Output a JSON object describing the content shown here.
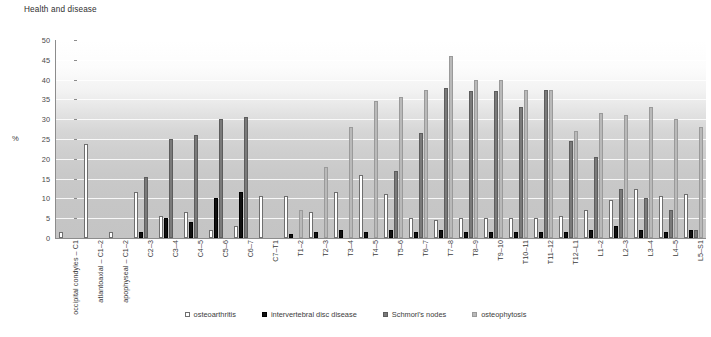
{
  "chart_data": {
    "type": "bar",
    "title": "Health and disease",
    "xlabel": "",
    "ylabel": "%",
    "ylim": [
      0,
      50
    ],
    "ytick_step": 5,
    "yticks": [
      0,
      5,
      10,
      15,
      20,
      25,
      30,
      35,
      40,
      45,
      50
    ],
    "grid": true,
    "legend_position": "bottom",
    "categories": [
      "occipital condyles – C1",
      "atlantoaxial – C1–2",
      "apophyseal – C1–2",
      "C2–3",
      "C3–4",
      "C4–5",
      "C5–6",
      "C6–7",
      "C7–T1",
      "T1–2",
      "T2–3",
      "T3–4",
      "T4–5",
      "T5–6",
      "T6–7",
      "T7–8",
      "T8–9",
      "T9–10",
      "T10–11",
      "T11–12",
      "T12–L1",
      "L1–2",
      "L2–3",
      "L3–4",
      "L4–5",
      "L5–S1"
    ],
    "series": [
      {
        "name": "osteoarthritis",
        "color": "#ffffff",
        "values": [
          1.5,
          23.8,
          1.5,
          11.5,
          5.5,
          6.5,
          2.0,
          3.0,
          10.5,
          10.5,
          6.5,
          11.5,
          16.0,
          11.0,
          5.0,
          4.5,
          5.0,
          5.0,
          5.0,
          5.0,
          5.5,
          7.0,
          9.5,
          12.5,
          10.5,
          11.0
        ]
      },
      {
        "name": "intervertebral disc disease",
        "color": "#111111",
        "values": [
          0.0,
          0.0,
          0.0,
          1.5,
          5.0,
          4.0,
          10.0,
          11.5,
          0.0,
          1.0,
          1.5,
          2.0,
          1.5,
          2.0,
          1.5,
          2.0,
          1.5,
          1.5,
          1.5,
          1.5,
          1.5,
          2.0,
          3.0,
          2.0,
          1.5,
          2.0
        ]
      },
      {
        "name": "Schmorl's nodes",
        "color": "#7a7a7a",
        "values": [
          0.0,
          0.0,
          0.0,
          15.5,
          25.0,
          26.0,
          30.0,
          30.5,
          0.0,
          0.0,
          0.0,
          0.0,
          0.0,
          17.0,
          26.5,
          38.0,
          37.0,
          37.0,
          33.0,
          37.5,
          24.5,
          20.5,
          12.5,
          10.0,
          7.0,
          2.0
        ]
      },
      {
        "name": "osteophytosis",
        "color": "#b9b9b9",
        "values": [
          0.0,
          0.0,
          0.0,
          0.0,
          0.0,
          0.0,
          0.0,
          0.0,
          0.0,
          7.0,
          18.0,
          28.0,
          34.5,
          35.5,
          37.5,
          46.0,
          40.0,
          40.0,
          37.5,
          37.5,
          27.0,
          31.5,
          31.0,
          33.0,
          30.0,
          28.0
        ]
      }
    ]
  }
}
